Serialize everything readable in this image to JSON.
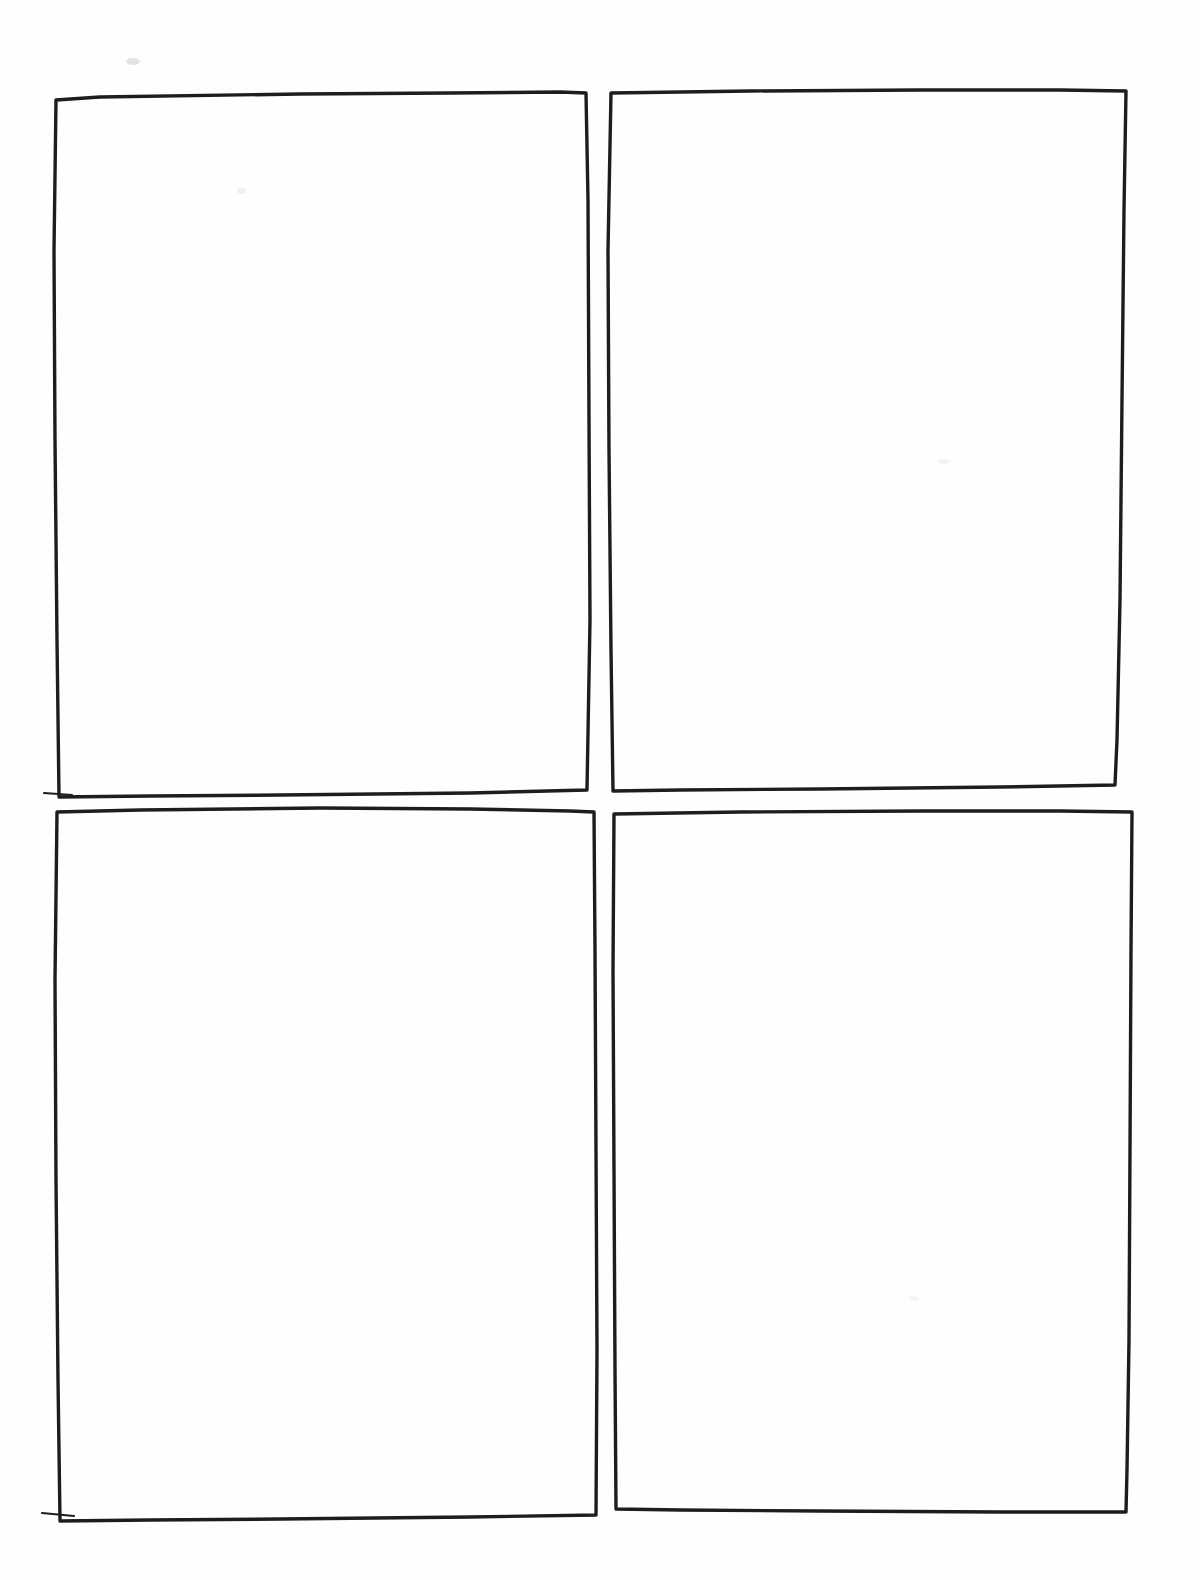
{
  "document": {
    "title": "Blank Storyboard Template",
    "media": "ink-on-paper-scan",
    "page_width": 1200,
    "page_height": 1580,
    "background_color": "#fefefe",
    "ink_color": "#1a1a1a",
    "layout": "2x2-grid",
    "panel_count": 4,
    "panels_are_empty": true
  },
  "panels": [
    {
      "id": "panel-1",
      "name": "top-left-panel",
      "position": "top-left",
      "index_label": "1",
      "content": "",
      "stroke_color": "#1d1d1d",
      "stroke_width": 3.4,
      "box": {
        "x": 55,
        "y": 95,
        "width": 533,
        "height": 702
      },
      "outline_path": "M 56 100 L 100 97 L 300 94 L 450 93 L 560 92 L 586 93 L 588 200 L 589 420 L 590 620 L 587 790 L 470 793 L 280 795 L 150 796 L 59 797 L 57 640 L 55 440 L 54 250 Z",
      "overshoot_ticks": [
        {
          "name": "bottom-left-overshoot",
          "x1": 44,
          "y1": 793,
          "x2": 72,
          "y2": 795
        }
      ]
    },
    {
      "id": "panel-2",
      "name": "top-right-panel",
      "position": "top-right",
      "index_label": "2",
      "content": "",
      "stroke_color": "#1d1d1d",
      "stroke_width": 3.4,
      "box": {
        "x": 610,
        "y": 90,
        "width": 518,
        "height": 695
      },
      "outline_path": "M 611 93 L 750 91 L 920 90 L 1060 90 L 1126 91 L 1124 210 L 1122 400 L 1120 600 L 1117 740 L 1115 785 L 1000 787 L 820 789 L 680 790 L 613 791 L 611 650 L 609 450 L 608 250 Z",
      "overshoot_ticks": []
    },
    {
      "id": "panel-3",
      "name": "bottom-left-panel",
      "position": "bottom-left",
      "index_label": "3",
      "content": "",
      "stroke_color": "#1d1d1d",
      "stroke_width": 3.4,
      "box": {
        "x": 55,
        "y": 808,
        "width": 533,
        "height": 712
      },
      "outline_path": "M 57 812 L 140 810 L 320 808 L 470 809 L 570 811 L 594 812 L 595 950 L 596 1150 L 597 1350 L 596 1515 L 470 1517 L 280 1519 L 150 1520 L 60 1521 L 58 1380 L 56 1180 L 55 980 Z",
      "overshoot_ticks": [
        {
          "name": "bottom-left-overshoot",
          "x1": 42,
          "y1": 1513,
          "x2": 74,
          "y2": 1516
        }
      ]
    },
    {
      "id": "panel-4",
      "name": "bottom-right-panel",
      "position": "bottom-right",
      "index_label": "4",
      "content": "",
      "stroke_color": "#1d1d1d",
      "stroke_width": 3.4,
      "box": {
        "x": 612,
        "y": 810,
        "width": 521,
        "height": 703
      },
      "outline_path": "M 614 814 L 740 812 L 920 811 L 1060 811 L 1132 812 L 1131 950 L 1130 1150 L 1129 1340 L 1127 1470 L 1126 1512 L 1000 1512 L 820 1511 L 680 1510 L 616 1509 L 615 1370 L 614 1170 L 613 970 Z",
      "overshoot_ticks": []
    }
  ],
  "artifacts": {
    "smudges": [
      {
        "name": "smudge-top-left",
        "x": 126,
        "y": 58,
        "width": 14,
        "height": 7,
        "color": "rgba(90,90,90,0.16)"
      },
      {
        "name": "smudge-upper-left-interior",
        "x": 237,
        "y": 188,
        "width": 9,
        "height": 6,
        "color": "rgba(120,120,120,0.10)"
      },
      {
        "name": "smudge-top-right-interior",
        "x": 938,
        "y": 459,
        "width": 11,
        "height": 5,
        "color": "rgba(120,120,120,0.08)"
      },
      {
        "name": "smudge-bottom-right-interior",
        "x": 909,
        "y": 1296,
        "width": 10,
        "height": 5,
        "color": "rgba(125,125,125,0.07)"
      }
    ]
  }
}
